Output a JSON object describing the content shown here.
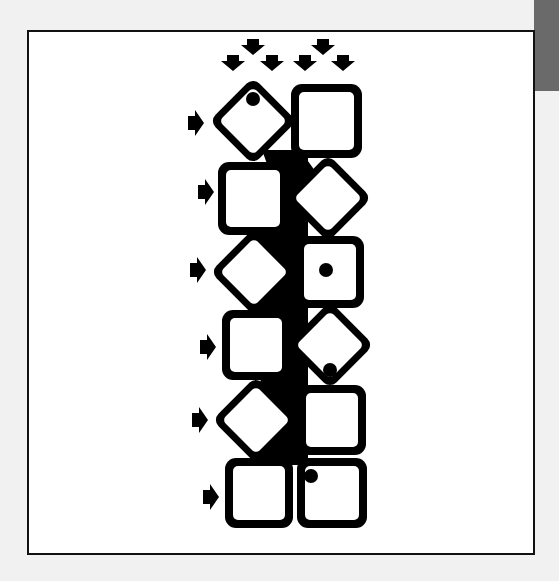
{
  "figure": {
    "background": "#f1f1f1",
    "frame_border_color": "#111111",
    "tab_color": "#6a6a6a",
    "ink_color": "#000000",
    "tile_fill": "#ffffff"
  },
  "top_arrows": [
    {
      "x": 253,
      "y": 47
    },
    {
      "x": 323,
      "y": 47
    },
    {
      "x": 233,
      "y": 63
    },
    {
      "x": 272,
      "y": 63
    },
    {
      "x": 305,
      "y": 63
    },
    {
      "x": 343,
      "y": 63
    }
  ],
  "side_arrows": [
    {
      "x": 188,
      "y": 123
    },
    {
      "x": 198,
      "y": 192
    },
    {
      "x": 190,
      "y": 270
    },
    {
      "x": 200,
      "y": 347
    },
    {
      "x": 192,
      "y": 420
    },
    {
      "x": 203,
      "y": 497
    }
  ],
  "rows": [
    {
      "left": {
        "shape": "diamond",
        "cx": 253,
        "cy": 121,
        "dot": {
          "x": 253,
          "y": 99
        }
      },
      "right": {
        "shape": "square",
        "x": 291,
        "y": 84,
        "w": 71,
        "h": 74,
        "dot": null
      }
    },
    {
      "left": {
        "shape": "square",
        "x": 218,
        "y": 162,
        "w": 70,
        "h": 73,
        "dot": null
      },
      "right": {
        "shape": "diamond",
        "cx": 328,
        "cy": 198,
        "dot": null
      }
    },
    {
      "left": {
        "shape": "diamond",
        "cx": 254,
        "cy": 272,
        "dot": null
      },
      "right": {
        "shape": "square",
        "x": 296,
        "y": 236,
        "w": 68,
        "h": 72,
        "dot": {
          "x": 326,
          "y": 270
        }
      }
    },
    {
      "left": {
        "shape": "square",
        "x": 222,
        "y": 310,
        "w": 68,
        "h": 70,
        "dot": null
      },
      "right": {
        "shape": "diamond",
        "cx": 330,
        "cy": 345,
        "dot": {
          "x": 330,
          "y": 370
        }
      }
    },
    {
      "left": {
        "shape": "diamond",
        "cx": 256,
        "cy": 420,
        "dot": null
      },
      "right": {
        "shape": "square",
        "x": 298,
        "y": 385,
        "w": 68,
        "h": 70,
        "dot": null
      }
    },
    {
      "left": {
        "shape": "square",
        "x": 225,
        "y": 458,
        "w": 68,
        "h": 70,
        "dot": null
      },
      "right": {
        "shape": "square",
        "x": 297,
        "y": 458,
        "w": 70,
        "h": 70,
        "dot": {
          "x": 311,
          "y": 476
        }
      }
    }
  ]
}
